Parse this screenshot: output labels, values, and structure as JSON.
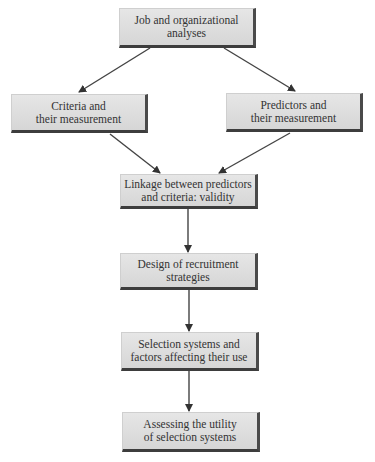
{
  "diagram": {
    "type": "flowchart",
    "nodes": [
      {
        "id": "job",
        "label": "Job and organizational\nanalyses"
      },
      {
        "id": "criteria",
        "label": "Criteria and\ntheir measurement"
      },
      {
        "id": "predictors",
        "label": "Predictors and\ntheir measurement"
      },
      {
        "id": "linkage",
        "label": "Linkage between predictors\nand criteria: validity"
      },
      {
        "id": "recruitment",
        "label": "Design of recruitment\nstrategies"
      },
      {
        "id": "selection",
        "label": "Selection systems and\nfactors affecting their use"
      },
      {
        "id": "utility",
        "label": "Assessing the utility\nof selection systems"
      }
    ],
    "edges": [
      {
        "from": "job",
        "to": "criteria"
      },
      {
        "from": "job",
        "to": "predictors"
      },
      {
        "from": "criteria",
        "to": "linkage"
      },
      {
        "from": "predictors",
        "to": "linkage"
      },
      {
        "from": "linkage",
        "to": "recruitment"
      },
      {
        "from": "recruitment",
        "to": "selection"
      },
      {
        "from": "selection",
        "to": "utility"
      }
    ]
  }
}
